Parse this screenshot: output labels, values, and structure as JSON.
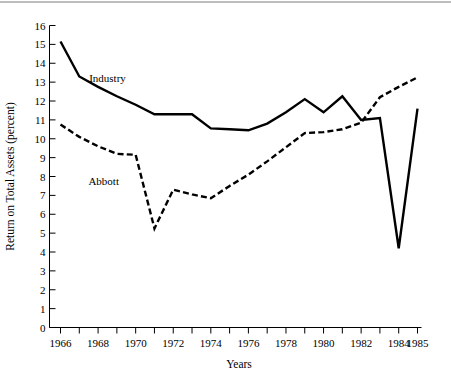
{
  "chart_data": {
    "type": "line",
    "title": "",
    "xlabel": "Years",
    "ylabel": "Return on Total Assets (percent)",
    "xlim": [
      1966,
      1985
    ],
    "ylim": [
      0,
      16
    ],
    "x": [
      1966,
      1967,
      1968,
      1969,
      1970,
      1971,
      1972,
      1973,
      1974,
      1975,
      1976,
      1977,
      1978,
      1979,
      1980,
      1981,
      1982,
      1983,
      1984,
      1985
    ],
    "xticks": [
      1966,
      1967,
      1968,
      1969,
      1970,
      1971,
      1972,
      1973,
      1974,
      1975,
      1976,
      1977,
      1978,
      1979,
      1980,
      1981,
      1982,
      1983,
      1984,
      1985
    ],
    "xticklabels": [
      "1966",
      "",
      "1968",
      "",
      "1970",
      "",
      "1972",
      "",
      "1974",
      "",
      "1976",
      "",
      "1978",
      "",
      "1980",
      "",
      "1982",
      "",
      "1984",
      "1985"
    ],
    "yticks": [
      0,
      1,
      2,
      3,
      4,
      5,
      6,
      7,
      8,
      9,
      10,
      11,
      12,
      13,
      14,
      15,
      16
    ],
    "yticklabels": [
      "0",
      "1",
      "2",
      "3",
      "4",
      "5",
      "6",
      "7",
      "8",
      "9",
      "10",
      "11",
      "12",
      "13",
      "14",
      "15",
      "16"
    ],
    "grid": false,
    "legend_position": "inline-annotation",
    "series": [
      {
        "name": "Industry",
        "style": "solid",
        "color": "#000000",
        "label_x": 1968.5,
        "label_y": 13.0,
        "values": [
          15.15,
          13.3,
          12.75,
          12.25,
          11.8,
          11.3,
          11.3,
          11.3,
          10.55,
          10.5,
          10.45,
          10.8,
          11.4,
          12.1,
          11.4,
          12.25,
          11.0,
          11.1,
          4.2,
          11.6
        ]
      },
      {
        "name": "Abbott",
        "style": "dashed",
        "color": "#000000",
        "label_x": 1968.3,
        "label_y": 7.55,
        "values": [
          10.75,
          10.1,
          9.6,
          9.2,
          9.15,
          5.25,
          7.3,
          7.05,
          6.85,
          7.5,
          8.1,
          8.8,
          9.55,
          10.3,
          10.35,
          10.5,
          10.85,
          12.2,
          12.75,
          13.25
        ]
      }
    ]
  },
  "axis": {
    "y_title": "Return on Total Assets (percent)",
    "x_title": "Years"
  },
  "colors": {
    "line": "#000000",
    "text": "#000000",
    "background": "#ffffff",
    "top_rule": "#bdbdbd"
  }
}
